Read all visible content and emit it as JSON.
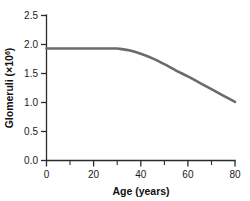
{
  "chart_data": {
    "type": "line",
    "title": "",
    "subtitle": "",
    "xlabel": "Age (years)",
    "ylabel": "Glomeruli (×10⁶)",
    "ylabel_base": "Glomeruli (×10",
    "ylabel_exponent": "6",
    "ylabel_close": ")",
    "xlim": [
      0,
      80
    ],
    "ylim": [
      0.0,
      2.5
    ],
    "grid": false,
    "legend": null,
    "x_ticks": [
      0,
      20,
      40,
      60,
      80
    ],
    "x_tick_labels": [
      "0",
      "20",
      "40",
      "60",
      "80"
    ],
    "x_minor_ticks": [
      10,
      30,
      50,
      70
    ],
    "y_ticks": [
      0.0,
      0.5,
      1.0,
      1.5,
      2.0,
      2.5
    ],
    "y_tick_labels": [
      "0.0",
      "0.5",
      "1.0",
      "1.5",
      "2.0",
      "2.5"
    ],
    "series": [
      {
        "name": "Glomeruli number",
        "color": "#6b6b6b",
        "x": [
          0,
          5,
          10,
          15,
          20,
          25,
          30,
          32,
          35,
          40,
          45,
          50,
          55,
          60,
          65,
          70,
          75,
          80
        ],
        "values": [
          1.93,
          1.93,
          1.93,
          1.93,
          1.93,
          1.93,
          1.93,
          1.92,
          1.9,
          1.84,
          1.76,
          1.66,
          1.55,
          1.45,
          1.34,
          1.23,
          1.12,
          1.01
        ]
      }
    ]
  },
  "axes": {
    "x_axis_name": "x-axis",
    "y_axis_name": "y-axis"
  }
}
